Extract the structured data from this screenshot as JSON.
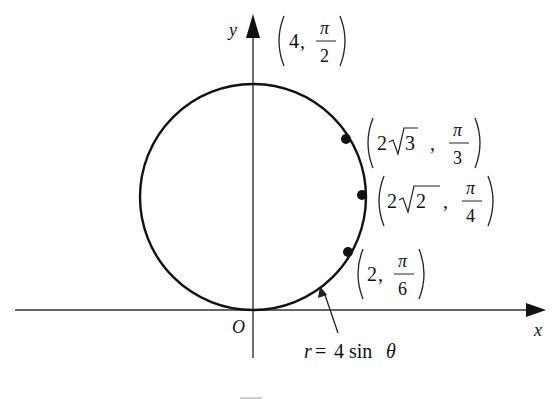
{
  "diagram": {
    "type": "polar-curve",
    "axes": {
      "x_label": "x",
      "y_label": "y",
      "origin_label": "O"
    },
    "curve": {
      "equation_r": "r",
      "equation_eq": "=",
      "equation_rhs": "4 sin",
      "equation_theta": "θ",
      "description": "circle r = 4 sin θ, tangent to x-axis at origin"
    },
    "points": [
      {
        "r_int": "4",
        "r_rad": "",
        "theta_num": "π",
        "theta_den": "2",
        "label": "(4, π/2)"
      },
      {
        "r_int": "2",
        "r_rad": "3",
        "theta_num": "π",
        "theta_den": "3",
        "label": "(2√3, π/3)"
      },
      {
        "r_int": "2",
        "r_rad": "2",
        "theta_num": "π",
        "theta_den": "4",
        "label": "(2√2, π/4)"
      },
      {
        "r_int": "2",
        "r_rad": "",
        "theta_num": "π",
        "theta_den": "6",
        "label": "(2, π/6)"
      }
    ],
    "comma": ","
  },
  "colors": {
    "ink": "#111111",
    "axis": "#333333",
    "background": "#ffffff"
  }
}
